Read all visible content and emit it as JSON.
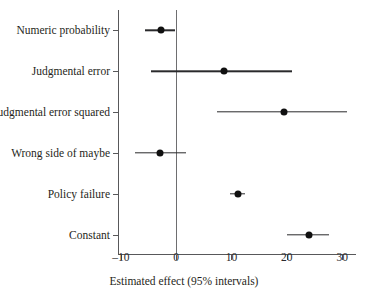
{
  "chart_data": {
    "type": "scatter",
    "subtype": "forest-plot",
    "title": "",
    "xlabel": "Estimated effect (95% intervals)",
    "ylabel": "",
    "xlim": [
      -10.5,
      32.5
    ],
    "xticks": [
      -10,
      0,
      10,
      20,
      30
    ],
    "xtick_labels": [
      "–10",
      "0",
      "10",
      "20",
      "30"
    ],
    "grid": false,
    "legend": false,
    "reference_line": 0,
    "categories": [
      "Numeric probability",
      "Judgmental error",
      "Judgmental error squared",
      "Wrong side of maybe",
      "Policy failure",
      "Constant"
    ],
    "estimates": [
      -2.7,
      8.7,
      19.5,
      -2.9,
      11.1,
      24.0
    ],
    "ci_low": [
      -5.6,
      -4.5,
      7.3,
      -7.5,
      9.8,
      20.0
    ],
    "ci_high": [
      -0.2,
      20.9,
      30.9,
      1.8,
      12.5,
      27.6
    ],
    "points": [
      {
        "label": "Numeric probability",
        "estimate": -2.7,
        "ci_low": -5.6,
        "ci_high": -0.2
      },
      {
        "label": "Judgmental error",
        "estimate": 8.7,
        "ci_low": -4.5,
        "ci_high": 20.9
      },
      {
        "label": "Judgmental error squared",
        "estimate": 19.5,
        "ci_low": 7.3,
        "ci_high": 30.9
      },
      {
        "label": "Wrong side of maybe",
        "estimate": -2.9,
        "ci_low": -7.5,
        "ci_high": 1.8
      },
      {
        "label": "Policy failure",
        "estimate": 11.1,
        "ci_low": 9.8,
        "ci_high": 12.5
      },
      {
        "label": "Constant",
        "estimate": 24.0,
        "ci_low": 20.0,
        "ci_high": 27.6
      }
    ],
    "colors": {
      "point": "#101010",
      "interval": "#2a2a2c",
      "axis": "#58585a",
      "reference_line": "#6e6e70",
      "background": "#ffffff",
      "text": "#1f1f21"
    }
  }
}
